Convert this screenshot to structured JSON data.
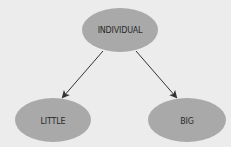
{
  "diagram": {
    "type": "tree",
    "colors": {
      "background": "#ececec",
      "node_fill": "#a9a9a9",
      "edge": "#333333",
      "text": "#2a2a2a"
    },
    "nodes": [
      {
        "id": "individual",
        "label": "INDIVIDUAL",
        "cx": 120,
        "cy": 30
      },
      {
        "id": "little",
        "label": "LITTLE",
        "cx": 53,
        "cy": 120
      },
      {
        "id": "big",
        "label": "BIG",
        "cx": 187,
        "cy": 120
      }
    ],
    "edges": [
      {
        "from": "individual",
        "to": "little"
      },
      {
        "from": "individual",
        "to": "big"
      }
    ]
  }
}
